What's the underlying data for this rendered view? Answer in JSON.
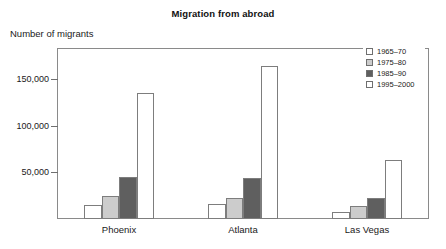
{
  "chart_data": {
    "type": "bar",
    "title": "Migration from abroad",
    "subtitle": "",
    "xlabel": "",
    "ylabel": "Number of migrants",
    "categories": [
      "Phoenix",
      "Atlanta",
      "Las Vegas"
    ],
    "series": [
      {
        "name": "1965–70",
        "values": [
          15000,
          16000,
          8000
        ],
        "color": "#ffffff"
      },
      {
        "name": "1975–80",
        "values": [
          25000,
          22000,
          14000
        ],
        "color": "#cccccc"
      },
      {
        "name": "1985–90",
        "values": [
          45000,
          44000,
          22000
        ],
        "color": "#5f5f5f"
      },
      {
        "name": "1995–2000",
        "values": [
          135000,
          164000,
          63000
        ],
        "color": "#ffffff"
      }
    ],
    "yticks": [
      50000,
      100000,
      150000
    ],
    "ytick_labels": [
      "50,000",
      "100,000",
      "150,000"
    ],
    "ylim": [
      0,
      183000
    ],
    "grid": false,
    "legend_position": "top-right-inside",
    "frame": true
  },
  "colors": {
    "frame": "#8a8a8a",
    "bar_outline": "#7d7d7d",
    "text": "#1a1a1a",
    "title": "#111111",
    "background": "#ffffff"
  }
}
